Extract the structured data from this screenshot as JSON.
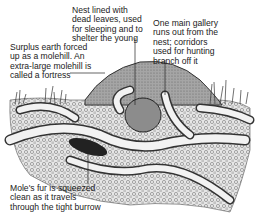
{
  "diagram": {
    "labels": {
      "nest": "Nest lined with\ndead leaves, used\nfor sleeping and to\nshelter the young",
      "gallery": "One main gallery\nruns out from the\nnest; corridors\nused for hunting\nbranch off it",
      "molehill": "Surplus earth forced\nup as a molehill. An\nextra-large molehill is\ncalled a fortress",
      "fur": "Mole's fur is squeezed\nclean as it travels\nthrough the tight burrow"
    },
    "colors": {
      "ink": "#222222",
      "soil": "#d9d9d9",
      "mound": "#9a9a9a",
      "tunnel": "#eeeeee"
    }
  }
}
